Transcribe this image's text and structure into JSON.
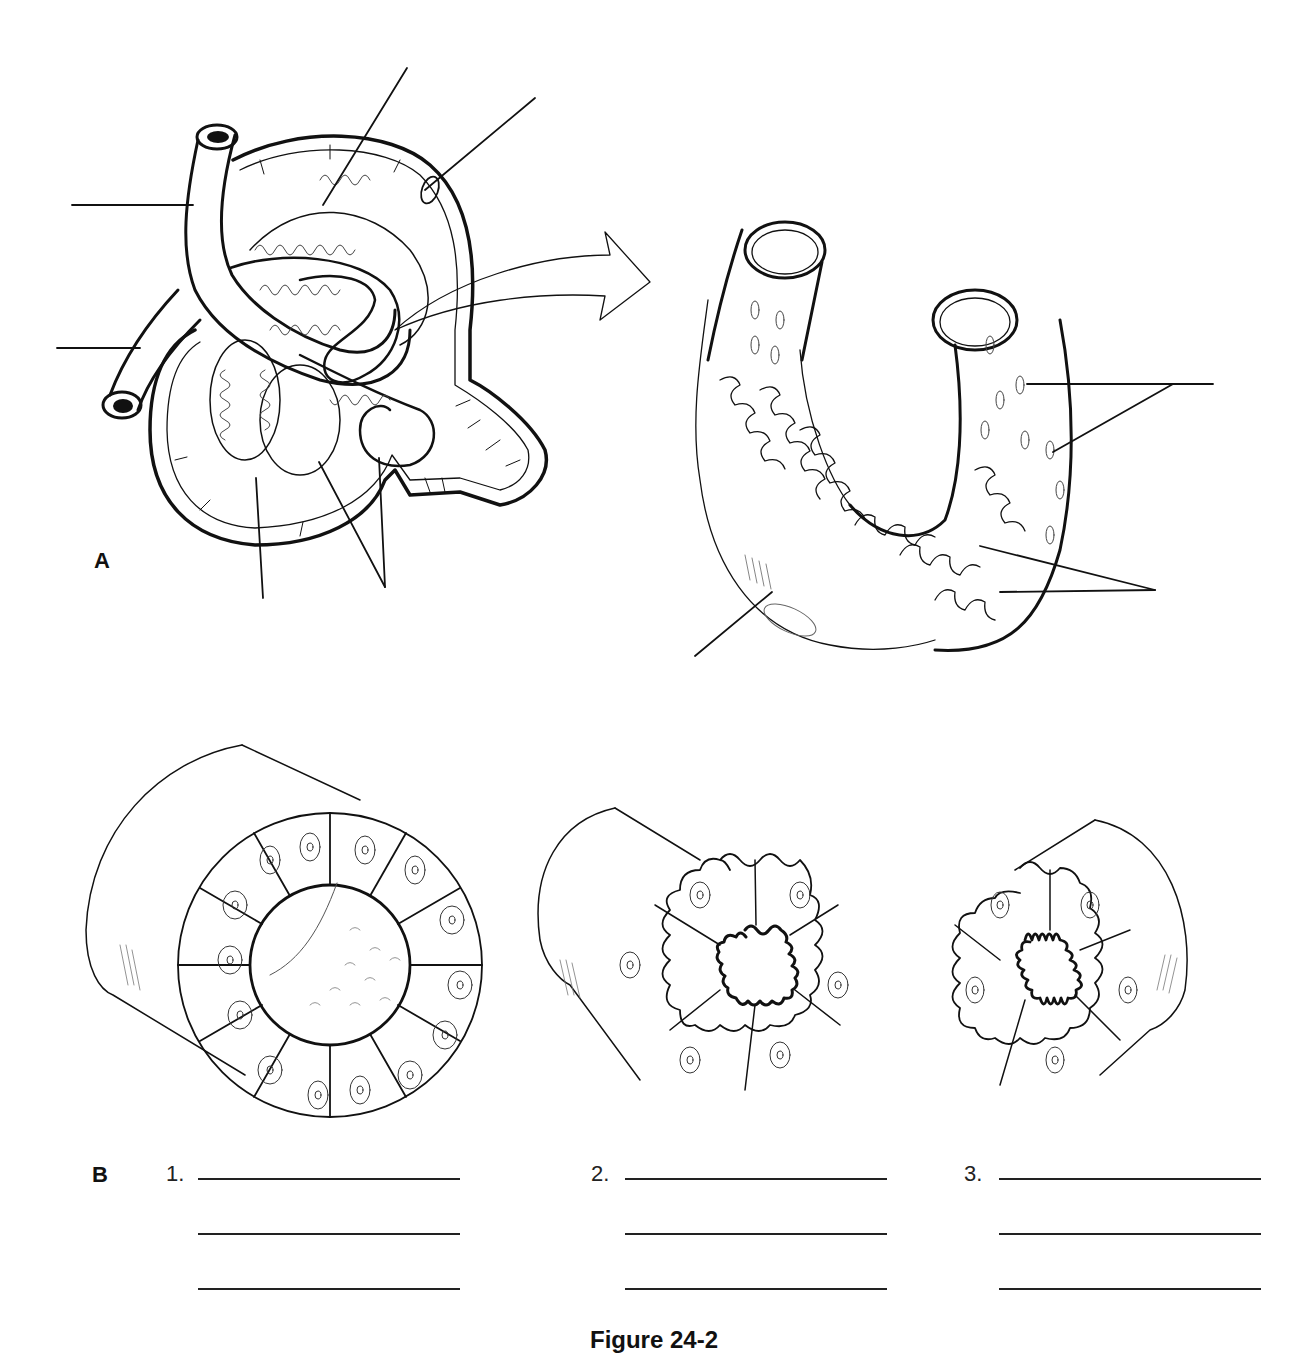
{
  "figure": {
    "caption": "Figure 24-2",
    "panels": [
      {
        "id": "A",
        "label": "A",
        "description": "Renal corpuscle with afferent/efferent arterioles, glomerular capillaries, Bowman's capsule and proximal tubule; magnified capillary loop view",
        "leader_lines": 9
      },
      {
        "id": "B",
        "label": "B",
        "description": "Cross sections of three tubule types",
        "items": [
          {
            "number": "1.",
            "blanks": 3
          },
          {
            "number": "2.",
            "blanks": 3
          },
          {
            "number": "3.",
            "blanks": 3
          }
        ]
      }
    ]
  },
  "colors": {
    "ink": "#111111",
    "background": "#ffffff"
  }
}
